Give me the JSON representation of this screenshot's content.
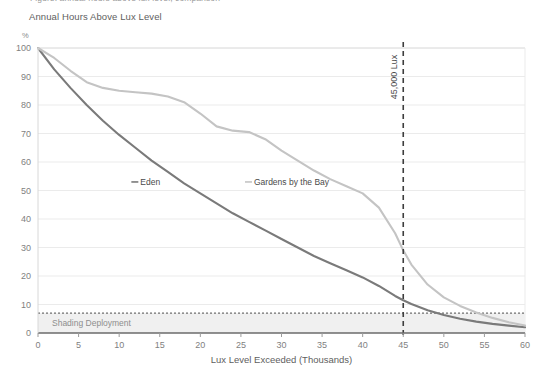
{
  "header": {
    "clipped_text": "Figure: annual hours above lux level, comparison",
    "title": "Annual Hours Above Lux Level"
  },
  "chart_data": {
    "type": "line",
    "title": "Annual Hours Above Lux Level",
    "xlabel": "Lux Level Exceeded (Thousands)",
    "ylabel": "%",
    "ylabel_unit": "%",
    "xlim": [
      0,
      60
    ],
    "ylim": [
      0,
      100
    ],
    "xticks": [
      0,
      5,
      10,
      15,
      20,
      25,
      30,
      35,
      40,
      45,
      50,
      55,
      60
    ],
    "xtick_labels": [
      "0",
      "5",
      "10",
      "15",
      "20",
      "25",
      "30",
      "35",
      "40",
      "45",
      "50",
      "55",
      "60"
    ],
    "yticks": [
      0,
      10,
      20,
      30,
      40,
      50,
      60,
      70,
      80,
      90,
      100
    ],
    "ytick_labels": [
      "0",
      "10",
      "20",
      "30",
      "40",
      "50",
      "60",
      "70",
      "80",
      "90",
      "100"
    ],
    "grid": "horizontal",
    "legend_position": "inline-labels",
    "x": [
      0,
      2,
      4,
      6,
      8,
      10,
      12,
      14,
      16,
      18,
      20,
      22,
      24,
      26,
      28,
      30,
      32,
      34,
      36,
      38,
      40,
      42,
      44,
      45,
      46,
      48,
      50,
      52,
      54,
      56,
      58,
      60
    ],
    "series": [
      {
        "name": "Eden",
        "color": "#7a7a7a",
        "label_x": 11.5,
        "label_y": 53,
        "values": [
          100,
          92.5,
          86,
          80,
          74.5,
          69.5,
          65,
          60.5,
          56.5,
          52.5,
          49,
          45.5,
          42,
          39,
          36,
          33,
          30,
          27,
          24.5,
          22,
          19.5,
          16.5,
          13,
          11.5,
          10.2,
          8.0,
          6.3,
          5.0,
          4.0,
          3.2,
          2.6,
          2.0
        ]
      },
      {
        "name": "Gardens by the Bay",
        "color": "#c4c4c4",
        "label_x": 25.5,
        "label_y": 53,
        "values": [
          100,
          96.5,
          92,
          88,
          86,
          85,
          84.5,
          84,
          83,
          81,
          77,
          72.5,
          71,
          70.5,
          68,
          64,
          60.5,
          57,
          54,
          51.5,
          49,
          44,
          35,
          29,
          24,
          17,
          12.5,
          9.5,
          7.2,
          5.3,
          3.8,
          2.6
        ]
      }
    ],
    "annotations": [
      {
        "name": "lux-threshold-marker",
        "type": "vline",
        "x": 45,
        "label": "45,000 Lux",
        "style": "dashed",
        "color": "#3d3d3d",
        "label_rotation": -90,
        "label_y": 82
      },
      {
        "name": "shading-deployment-band",
        "type": "hband",
        "y_from": 0,
        "y_to": 7,
        "label": "Shading Deployment",
        "fill": "#f0f0f0",
        "border_style": "dotted",
        "border_color": "#6f6f6f"
      }
    ]
  }
}
